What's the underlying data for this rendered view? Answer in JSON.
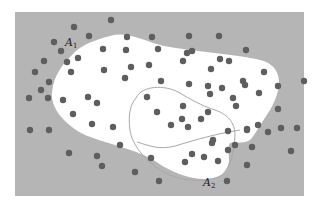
{
  "figure": {
    "background_color": "#b5b5b5",
    "region_fill": "#ffffff",
    "dot_color": "#5e5e5e",
    "outline_color": "#a8a8a8",
    "labels": {
      "a1": {
        "main": "A",
        "sub": "1"
      },
      "a2": {
        "main": "A",
        "sub": "2"
      }
    },
    "dots": [
      [
        74,
        27
      ],
      [
        111,
        20
      ],
      [
        54,
        42
      ],
      [
        89,
        36
      ],
      [
        127,
        37
      ],
      [
        152,
        37
      ],
      [
        189,
        36
      ],
      [
        219,
        36
      ],
      [
        44,
        61
      ],
      [
        61,
        51
      ],
      [
        67,
        62
      ],
      [
        78,
        58
      ],
      [
        103,
        49
      ],
      [
        126,
        50
      ],
      [
        158,
        49
      ],
      [
        187,
        53
      ],
      [
        192,
        51
      ],
      [
        220,
        59
      ],
      [
        246,
        50
      ],
      [
        229,
        61
      ],
      [
        35,
        72
      ],
      [
        41,
        90
      ],
      [
        49,
        82
      ],
      [
        29,
        98
      ],
      [
        48,
        98
      ],
      [
        71,
        72
      ],
      [
        104,
        70
      ],
      [
        125,
        78
      ],
      [
        131,
        67
      ],
      [
        149,
        65
      ],
      [
        183,
        61
      ],
      [
        211,
        69
      ],
      [
        243,
        81
      ],
      [
        264,
        72
      ],
      [
        245,
        85
      ],
      [
        259,
        93
      ],
      [
        30,
        130
      ],
      [
        49,
        130
      ],
      [
        73,
        114
      ],
      [
        97,
        103
      ],
      [
        92,
        124
      ],
      [
        113,
        127
      ],
      [
        63,
        100
      ],
      [
        88,
        97
      ],
      [
        147,
        97
      ],
      [
        157,
        112
      ],
      [
        182,
        119
      ],
      [
        183,
        106
      ],
      [
        208,
        86
      ],
      [
        210,
        94
      ],
      [
        161,
        81
      ],
      [
        189,
        84
      ],
      [
        222,
        88
      ],
      [
        233,
        98
      ],
      [
        236,
        106
      ],
      [
        278,
        86
      ],
      [
        278,
        109
      ],
      [
        281,
        128
      ],
      [
        304,
        81
      ],
      [
        213,
        140
      ],
      [
        228,
        131
      ],
      [
        201,
        119
      ],
      [
        208,
        112
      ],
      [
        171,
        125
      ],
      [
        188,
        127
      ],
      [
        212,
        143
      ],
      [
        151,
        158
      ],
      [
        192,
        154
      ],
      [
        218,
        161
      ],
      [
        228,
        150
      ],
      [
        235,
        145
      ],
      [
        247,
        130
      ],
      [
        258,
        125
      ],
      [
        268,
        132
      ],
      [
        291,
        151
      ],
      [
        297,
        128
      ],
      [
        247,
        165
      ],
      [
        252,
        147
      ],
      [
        227,
        181
      ],
      [
        247,
        129
      ],
      [
        120,
        145
      ],
      [
        159,
        181
      ],
      [
        97,
        156
      ],
      [
        102,
        166
      ],
      [
        69,
        153
      ],
      [
        135,
        172
      ],
      [
        185,
        162
      ],
      [
        204,
        157
      ]
    ]
  }
}
